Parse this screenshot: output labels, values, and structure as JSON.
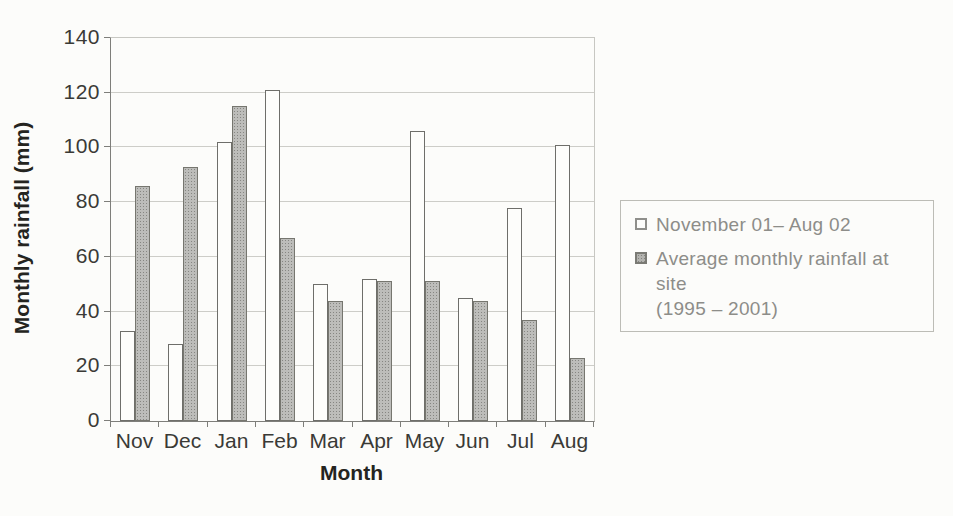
{
  "chart_data": {
    "type": "bar",
    "title": "",
    "xlabel": "Month",
    "ylabel": "Monthly rainfall (mm)",
    "categories": [
      "Nov",
      "Dec",
      "Jan",
      "Feb",
      "Mar",
      "Apr",
      "May",
      "Jun",
      "Jul",
      "Aug"
    ],
    "series": [
      {
        "name": "November 01– Aug 02",
        "key": "nov01-aug02",
        "legend_lines": [
          "November 01– Aug 02"
        ],
        "values": [
          33,
          28,
          102,
          121,
          50,
          52,
          106,
          45,
          78,
          101
        ],
        "pattern": "plain",
        "fill": "#fdfdfb",
        "border": "#6e6e6a"
      },
      {
        "name": "Average monthly rainfall at site (1995 – 2001)",
        "key": "average-1995-2001",
        "legend_lines": [
          "Average monthly rainfall at site",
          "(1995 – 2001)"
        ],
        "values": [
          86,
          93,
          115,
          67,
          44,
          51,
          51,
          44,
          37,
          23
        ],
        "pattern": "stipple",
        "fill": "#bdbdba",
        "border": "#76766f"
      }
    ],
    "ylim": [
      0,
      140
    ],
    "yticks": [
      0,
      20,
      40,
      60,
      80,
      100,
      120,
      140
    ],
    "grid": true,
    "legend_position": "right"
  },
  "colors": {
    "background": "#fcfcfa",
    "axis": "#7e7e7a",
    "gridline": "#cdcdc8",
    "tick_text": "#3a3a36",
    "axis_title_text": "#242420",
    "legend_text": "#8d8d89",
    "legend_border": "#bcbcb6"
  }
}
